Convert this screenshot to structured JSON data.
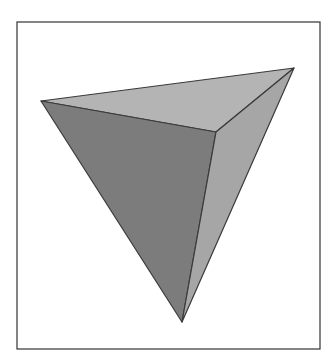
{
  "figure": {
    "frame": {
      "x": 17,
      "y": 22,
      "width": 303,
      "height": 327,
      "stroke": "#333333"
    },
    "vertices": {
      "left": [
        41,
        101
      ],
      "top_right": [
        294,
        68
      ],
      "front": [
        216,
        132
      ],
      "bottom": [
        182,
        322
      ]
    },
    "faces": {
      "top": {
        "fill": "#b4b4b4"
      },
      "left_front": {
        "fill": "#7c7c7c"
      },
      "right_front": {
        "fill": "#a6a6a6"
      }
    },
    "edge_color": "#3a3a3a"
  }
}
